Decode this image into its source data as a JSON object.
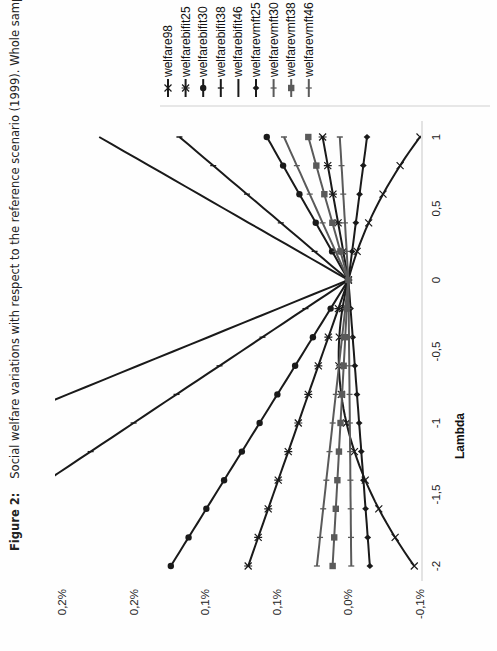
{
  "caption": {
    "figure_label": "Figure 2:",
    "text": "Social welfare variations with respect to the reference scenario (1999). Whole sample"
  },
  "chart_data": {
    "type": "line",
    "title": "Social welfare variations with respect to the reference scenario (1999). Whole sample",
    "xlabel": "Lambda",
    "ylabel": "",
    "x": [
      -2,
      -1.8,
      -1.6,
      -1.4,
      -1.2,
      -1,
      -0.8,
      -0.6,
      -0.4,
      -0.2,
      0,
      0.2,
      0.4,
      0.6,
      0.8,
      1
    ],
    "x_ticks": [
      -2,
      -1.5,
      -1,
      -0.5,
      0,
      0.5,
      1
    ],
    "x_tick_labels": [
      "-2",
      "-1,5",
      "-1",
      "-0,5",
      "0",
      "0,5",
      "1"
    ],
    "xlim": [
      -2,
      1
    ],
    "y_ticks": [
      -0.05,
      0.0,
      0.05,
      0.1,
      0.15,
      0.2
    ],
    "y_tick_labels": [
      "-0,1%",
      "0,0%",
      "0,1%",
      "0,1%",
      "0,2%",
      "0,2%"
    ],
    "ylim": [
      -0.05,
      0.2
    ],
    "y_unit": "%",
    "grid": false,
    "legend_position": "right",
    "series": [
      {
        "name": "welfare98",
        "marker": "x",
        "color": "#1a1a1a",
        "start": -0.046,
        "end": -0.05,
        "curve": "parabola"
      },
      {
        "name": "welfarebifit25",
        "marker": "asterisk",
        "color": "#1a1a1a",
        "start": 0.07,
        "end": 0.018
      },
      {
        "name": "welfarebifit30",
        "marker": "circle",
        "color": "#1a1a1a",
        "start": 0.124,
        "end": 0.057
      },
      {
        "name": "welfarebifit38",
        "marker": "tick",
        "color": "#1a1a1a",
        "start": 0.3,
        "end": 0.118
      },
      {
        "name": "welfarebifit46",
        "marker": "none",
        "color": "#1a1a1a",
        "start": 0.49,
        "end": 0.174
      },
      {
        "name": "welfarevmft25",
        "marker": "diamond",
        "color": "#1a1a1a",
        "start": -0.015,
        "end": -0.013
      },
      {
        "name": "welfarevmft30",
        "marker": "tick",
        "color": "#5a5a5a",
        "start": 0.022,
        "end": 0.045
      },
      {
        "name": "welfarevmft38",
        "marker": "square",
        "color": "#5a5a5a",
        "start": 0.011,
        "end": 0.028
      },
      {
        "name": "welfarevmft46",
        "marker": "tick",
        "color": "#5a5a5a",
        "start": -0.002,
        "end": 0.006
      }
    ]
  }
}
